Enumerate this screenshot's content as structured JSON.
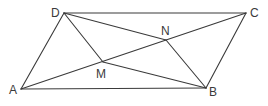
{
  "diagram": {
    "type": "geometry",
    "stroke_color": "#3a3a3a",
    "points": {
      "A": {
        "x": 21,
        "y": 89,
        "label": "A"
      },
      "B": {
        "x": 206,
        "y": 88,
        "label": "B"
      },
      "C": {
        "x": 246,
        "y": 13,
        "label": "C"
      },
      "D": {
        "x": 64,
        "y": 13,
        "label": "D"
      },
      "M": {
        "x": 103,
        "y": 62,
        "label": "M"
      },
      "N": {
        "x": 166,
        "y": 40,
        "label": "N"
      }
    },
    "segments": [
      [
        "A",
        "B"
      ],
      [
        "B",
        "C"
      ],
      [
        "C",
        "D"
      ],
      [
        "D",
        "A"
      ],
      [
        "A",
        "C"
      ],
      [
        "D",
        "M"
      ],
      [
        "M",
        "B"
      ],
      [
        "D",
        "N"
      ],
      [
        "N",
        "B"
      ]
    ],
    "labels": {
      "A": "A",
      "B": "B",
      "C": "C",
      "D": "D",
      "M": "M",
      "N": "N"
    }
  }
}
